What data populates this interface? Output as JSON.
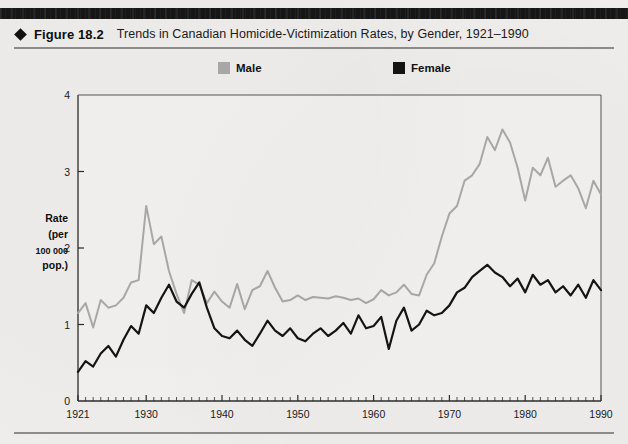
{
  "figure": {
    "label": "Figure 18.2",
    "caption": "Trends in Canadian Homicide-Victimization Rates, by Gender, 1921–1990",
    "marker_icon": "diamond-icon"
  },
  "legend": {
    "position": "top-center",
    "items": [
      {
        "label": "Male",
        "color": "#a9a9a9",
        "swatch": "square"
      },
      {
        "label": "Female",
        "color": "#141414",
        "swatch": "square"
      }
    ]
  },
  "axes": {
    "y": {
      "label_lines": [
        "Rate",
        "(per",
        "100 000",
        "pop.)"
      ],
      "ticks": [
        "0",
        "1",
        "2",
        "3",
        "4"
      ],
      "min": 0,
      "max": 4
    },
    "x": {
      "ticks": [
        "1921",
        "1930",
        "1940",
        "1950",
        "1960",
        "1970",
        "1980",
        "1990"
      ],
      "min": 1921,
      "max": 1990,
      "minor_tick_interval": 1
    }
  },
  "chart_data": {
    "type": "line",
    "title": "Trends in Canadian Homicide-Victimization Rates, by Gender, 1921–1990",
    "xlabel": "",
    "ylabel": "Rate (per 100 000 pop.)",
    "xlim": [
      1921,
      1990
    ],
    "ylim": [
      0,
      4
    ],
    "grid": false,
    "legend_position": "top-center",
    "x": [
      1921,
      1922,
      1923,
      1924,
      1925,
      1926,
      1927,
      1928,
      1929,
      1930,
      1931,
      1932,
      1933,
      1934,
      1935,
      1936,
      1937,
      1938,
      1939,
      1940,
      1941,
      1942,
      1943,
      1944,
      1945,
      1946,
      1947,
      1948,
      1949,
      1950,
      1951,
      1952,
      1953,
      1954,
      1955,
      1956,
      1957,
      1958,
      1959,
      1960,
      1961,
      1962,
      1963,
      1964,
      1965,
      1966,
      1967,
      1968,
      1969,
      1970,
      1971,
      1972,
      1973,
      1974,
      1975,
      1976,
      1977,
      1978,
      1979,
      1980,
      1981,
      1982,
      1983,
      1984,
      1985,
      1986,
      1987,
      1988,
      1989,
      1990
    ],
    "series": [
      {
        "name": "Male",
        "color": "#a9a9a9",
        "values": [
          1.15,
          1.28,
          0.96,
          1.32,
          1.22,
          1.25,
          1.35,
          1.55,
          1.58,
          2.55,
          2.05,
          2.15,
          1.7,
          1.4,
          1.15,
          1.58,
          1.52,
          1.28,
          1.43,
          1.3,
          1.22,
          1.53,
          1.2,
          1.45,
          1.5,
          1.7,
          1.48,
          1.3,
          1.32,
          1.38,
          1.32,
          1.36,
          1.35,
          1.34,
          1.37,
          1.35,
          1.32,
          1.34,
          1.28,
          1.33,
          1.45,
          1.38,
          1.42,
          1.52,
          1.4,
          1.38,
          1.65,
          1.8,
          2.15,
          2.45,
          2.55,
          2.88,
          2.95,
          3.1,
          3.45,
          3.28,
          3.55,
          3.38,
          3.05,
          2.62,
          3.05,
          2.95,
          3.18,
          2.8,
          2.88,
          2.95,
          2.78,
          2.52,
          2.88,
          2.7
        ]
      },
      {
        "name": "Female",
        "color": "#141414",
        "values": [
          0.38,
          0.52,
          0.45,
          0.62,
          0.72,
          0.58,
          0.8,
          0.98,
          0.88,
          1.25,
          1.15,
          1.35,
          1.52,
          1.3,
          1.22,
          1.4,
          1.55,
          1.22,
          0.95,
          0.85,
          0.82,
          0.92,
          0.8,
          0.72,
          0.88,
          1.05,
          0.92,
          0.85,
          0.95,
          0.82,
          0.78,
          0.88,
          0.95,
          0.85,
          0.92,
          1.02,
          0.88,
          1.12,
          0.95,
          0.98,
          1.1,
          0.68,
          1.05,
          1.22,
          0.92,
          1.0,
          1.18,
          1.12,
          1.15,
          1.25,
          1.42,
          1.48,
          1.62,
          1.7,
          1.78,
          1.68,
          1.62,
          1.5,
          1.6,
          1.42,
          1.65,
          1.52,
          1.58,
          1.42,
          1.5,
          1.38,
          1.52,
          1.35,
          1.58,
          1.45
        ]
      }
    ]
  }
}
